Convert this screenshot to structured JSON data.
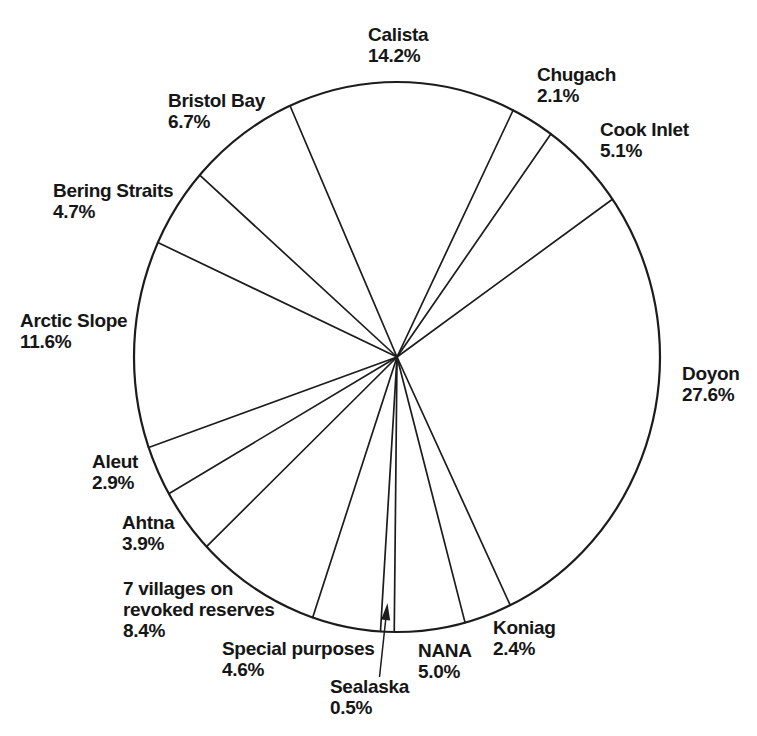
{
  "page": {
    "background": "#ffffff",
    "text_color": "#161616",
    "line_color": "#1c1c1c"
  },
  "chart_data": {
    "type": "pie",
    "title": "",
    "units": "percent",
    "categories": [
      "Calista",
      "Chugach",
      "Cook Inlet",
      "Doyon",
      "Koniag",
      "NANA",
      "Sealaska",
      "Special purposes",
      "7 villages on revoked reserves",
      "Ahtna",
      "Aleut",
      "Arctic Slope",
      "Bering Straits",
      "Bristol Bay"
    ],
    "values": [
      14.2,
      2.1,
      5.1,
      27.6,
      2.4,
      5.0,
      0.5,
      4.6,
      8.4,
      3.9,
      2.9,
      11.6,
      4.7,
      6.7
    ],
    "legend": "none",
    "labels_outside": true,
    "slices": [
      {
        "id": "calista",
        "label": "Calista",
        "value": 14.2,
        "pct_text": "14.2%",
        "start_angle_deg": 336.0,
        "label_lines": [
          "Calista",
          "14.2%"
        ],
        "label_pos": {
          "x": 368,
          "y": 24
        }
      },
      {
        "id": "chugach",
        "label": "Chugach",
        "value": 2.1,
        "pct_text": "2.1%",
        "start_angle_deg": 26.2,
        "label_lines": [
          "Chugach",
          "2.1%"
        ],
        "label_pos": {
          "x": 537,
          "y": 64
        }
      },
      {
        "id": "cook-inlet",
        "label": "Cook Inlet",
        "value": 5.1,
        "pct_text": "5.1%",
        "start_angle_deg": 35.8,
        "label_lines": [
          "Cook Inlet",
          "5.1%"
        ],
        "label_pos": {
          "x": 600,
          "y": 119
        }
      },
      {
        "id": "doyon",
        "label": "Doyon",
        "value": 27.6,
        "pct_text": "27.6%",
        "start_angle_deg": 55.0,
        "label_lines": [
          "Doyon",
          "27.6%"
        ],
        "label_pos": {
          "x": 682,
          "y": 363
        }
      },
      {
        "id": "koniag",
        "label": "Koniag",
        "value": 2.4,
        "pct_text": "2.4%",
        "start_angle_deg": 154.5,
        "label_lines": [
          "Koniag",
          "2.4%"
        ],
        "label_pos": {
          "x": 493,
          "y": 617
        }
      },
      {
        "id": "nana",
        "label": "NANA",
        "value": 5.0,
        "pct_text": "5.0%",
        "start_angle_deg": 165.0,
        "label_lines": [
          "NANA",
          "5.0%"
        ],
        "label_pos": {
          "x": 418,
          "y": 640
        }
      },
      {
        "id": "sealaska",
        "label": "Sealaska",
        "value": 0.5,
        "pct_text": "0.5%",
        "start_angle_deg": 180.6,
        "label_lines": [
          "Sealaska",
          "0.5%"
        ],
        "label_pos": {
          "x": 330,
          "y": 676
        }
      },
      {
        "id": "special-purposes",
        "label": "Special purposes",
        "value": 4.6,
        "pct_text": "4.6%",
        "start_angle_deg": 183.6,
        "label_lines": [
          "Special purposes",
          "4.6%"
        ],
        "label_pos": {
          "x": 222,
          "y": 638
        }
      },
      {
        "id": "seven-villages-on-revoked-reserves",
        "label": "7 villages on revoked reserves",
        "value": 8.4,
        "pct_text": "8.4%",
        "start_angle_deg": 198.7,
        "label_lines": [
          "7 villages on",
          "revoked reserves",
          "8.4%"
        ],
        "label_pos": {
          "x": 123,
          "y": 578
        }
      },
      {
        "id": "ahtna",
        "label": "Ahtna",
        "value": 3.9,
        "pct_text": "3.9%",
        "start_angle_deg": 226.4,
        "label_lines": [
          "Ahtna",
          "3.9%"
        ],
        "label_pos": {
          "x": 122,
          "y": 512
        }
      },
      {
        "id": "aleut",
        "label": "Aleut",
        "value": 2.9,
        "pct_text": "2.9%",
        "start_angle_deg": 240.2,
        "label_lines": [
          "Aleut",
          "2.9%"
        ],
        "label_pos": {
          "x": 92,
          "y": 451
        }
      },
      {
        "id": "arctic-slope",
        "label": "Arctic Slope",
        "value": 11.6,
        "pct_text": "11.6%",
        "start_angle_deg": 250.8,
        "label_lines": [
          "Arctic Slope",
          "11.6%"
        ],
        "label_pos": {
          "x": 20,
          "y": 310
        }
      },
      {
        "id": "bering-straits",
        "label": "Bering Straits",
        "value": 4.7,
        "pct_text": "4.7%",
        "start_angle_deg": 294.6,
        "label_lines": [
          "Bering Straits",
          "4.7%"
        ],
        "label_pos": {
          "x": 53,
          "y": 180
        }
      },
      {
        "id": "bristol-bay",
        "label": "Bristol Bay",
        "value": 6.7,
        "pct_text": "6.7%",
        "start_angle_deg": 311.4,
        "label_lines": [
          "Bristol Bay",
          "6.7%"
        ],
        "label_pos": {
          "x": 168,
          "y": 90
        }
      }
    ],
    "layout": {
      "clockwise_from_top": true,
      "center": {
        "x": 397,
        "y": 357
      },
      "radius_x": 263,
      "radius_y": 275,
      "circle_stroke_width": 2.2,
      "line_stroke_width": 1.7,
      "stroke_color": "#1c1c1c"
    },
    "annotation_arrow": {
      "target_slice": "sealaska",
      "from": {
        "x": 379.5,
        "y": 677
      },
      "to": {
        "x": 387.5,
        "y": 603
      },
      "head_length": 17,
      "head_half_width": 4.5
    }
  }
}
